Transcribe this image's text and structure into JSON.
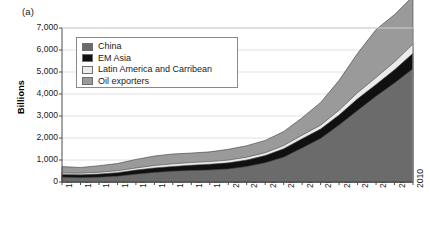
{
  "panel": {
    "label": "(a)"
  },
  "axes": {
    "ylabel": "Billions",
    "yticks": [
      "0",
      "1,000",
      "2,000",
      "3,000",
      "4,000",
      "5,000",
      "6,000",
      "7,000"
    ],
    "xticks": [
      "1991",
      "1992",
      "1993",
      "1994",
      "1995",
      "1996",
      "1997",
      "1998",
      "1999",
      "2000",
      "2001",
      "2002",
      "2003",
      "2004",
      "2005",
      "2006",
      "2007",
      "2008",
      "2009",
      "2010"
    ]
  },
  "legend": {
    "items": [
      {
        "label": "China",
        "color": "#6b6b6b",
        "swatch_name": "legend-swatch-china"
      },
      {
        "label": "EM Asia",
        "color": "#101010",
        "swatch_name": "legend-swatch-em-asia"
      },
      {
        "label": "Latin America and Carribean",
        "color": "#ebebeb",
        "swatch_name": "legend-swatch-latin-america"
      },
      {
        "label": "Oil exporters",
        "color": "#9a9a9a",
        "swatch_name": "legend-swatch-oil-exporters"
      }
    ]
  },
  "chart_data": {
    "type": "area",
    "stacked": true,
    "title": "",
    "subtitle": "",
    "xlabel": "",
    "ylabel": "Billions",
    "ylim": [
      0,
      7000
    ],
    "ytick_step": 1000,
    "grid": true,
    "grid_axis": "y",
    "legend_position": "top-left-inside",
    "annotations": [
      "(a)"
    ],
    "x": [
      1991,
      1992,
      1993,
      1994,
      1995,
      1996,
      1997,
      1998,
      1999,
      2000,
      2001,
      2002,
      2003,
      2004,
      2005,
      2006,
      2007,
      2008,
      2009,
      2010
    ],
    "categories": [
      "1991",
      "1992",
      "1993",
      "1994",
      "1995",
      "1996",
      "1997",
      "1998",
      "1999",
      "2000",
      "2001",
      "2002",
      "2003",
      "2004",
      "2005",
      "2006",
      "2007",
      "2008",
      "2009",
      "2010"
    ],
    "series": [
      {
        "name": "China",
        "color": "#6b6b6b",
        "values": [
          220,
          195,
          215,
          260,
          350,
          430,
          490,
          520,
          540,
          590,
          700,
          870,
          1130,
          1550,
          1980,
          2590,
          3250,
          3900,
          4500,
          5150
        ]
      },
      {
        "name": "EM Asia",
        "color": "#101010",
        "values": [
          120,
          130,
          145,
          165,
          190,
          210,
          215,
          245,
          270,
          280,
          300,
          330,
          380,
          420,
          430,
          460,
          530,
          530,
          600,
          700
        ]
      },
      {
        "name": "Latin America and Carribean",
        "color": "#ebebeb",
        "values": [
          70,
          75,
          80,
          85,
          95,
          110,
          120,
          120,
          120,
          125,
          130,
          130,
          145,
          160,
          175,
          210,
          280,
          320,
          360,
          420
        ]
      },
      {
        "name": "Oil exporters",
        "color": "#9a9a9a",
        "values": [
          290,
          260,
          300,
          330,
          390,
          430,
          450,
          430,
          440,
          490,
          520,
          560,
          640,
          790,
          1030,
          1360,
          1790,
          2180,
          2150,
          2180
        ]
      }
    ],
    "totals": [
      700,
      660,
      740,
      840,
      1025,
      1180,
      1275,
      1315,
      1370,
      1485,
      1650,
      1890,
      2295,
      2920,
      3615,
      4620,
      5850,
      6930,
      7610,
      8450
    ]
  }
}
